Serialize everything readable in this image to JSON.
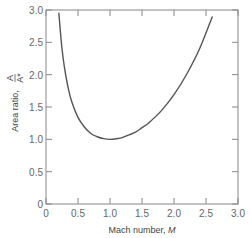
{
  "chart_data": {
    "type": "line",
    "title": "",
    "xlabel": "Mach number, M",
    "ylabel": "Area ratio, A/A*",
    "xlim": [
      0,
      3.0
    ],
    "ylim": [
      0,
      3.0
    ],
    "x_ticks": [
      "0",
      "0.5",
      "1.0",
      "1.5",
      "2.0",
      "2.5",
      "3.0"
    ],
    "y_ticks": [
      "0",
      "0.5",
      "1.0",
      "1.5",
      "2.0",
      "2.5",
      "3.0"
    ],
    "grid": false,
    "legend": null,
    "series": [
      {
        "name": "A/A* vs M (isentropic, k=1.4)",
        "x": [
          0.2,
          0.25,
          0.3,
          0.35,
          0.4,
          0.5,
          0.6,
          0.7,
          0.8,
          0.9,
          1.0,
          1.1,
          1.2,
          1.3,
          1.4,
          1.5,
          1.6,
          1.8,
          2.0,
          2.2,
          2.4,
          2.6
        ],
        "y": [
          2.96,
          2.4,
          2.04,
          1.78,
          1.59,
          1.34,
          1.19,
          1.09,
          1.04,
          1.01,
          1.0,
          1.01,
          1.03,
          1.07,
          1.11,
          1.18,
          1.25,
          1.44,
          1.69,
          2.01,
          2.4,
          2.9
        ]
      }
    ]
  },
  "labels": {
    "xlabel_text": "Mach number, ",
    "xlabel_var": "M",
    "ylabel_text": "Area ratio, ",
    "ylabel_num": "A",
    "ylabel_den": "A*"
  }
}
